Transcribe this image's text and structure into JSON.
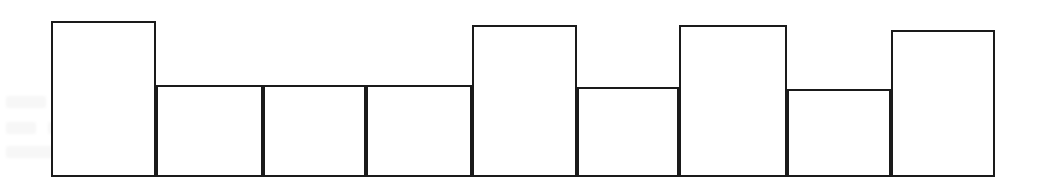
{
  "figure": {
    "title": "",
    "background_color": "#ffffff",
    "width": 1049,
    "height": 195
  },
  "chart_data": {
    "type": "bar",
    "title": "",
    "subtitle": "",
    "xlabel": "",
    "ylabel": "",
    "categories": [
      "1",
      "2",
      "3",
      "4",
      "5",
      "6",
      "7",
      "8",
      "9"
    ],
    "values": [
      155,
      91,
      91,
      91,
      151,
      89,
      151,
      87,
      146
    ],
    "bin_edges": [
      51,
      156,
      263,
      366,
      472,
      577,
      679,
      787,
      891,
      995
    ],
    "baseline_y": 176,
    "ylim": [
      0,
      160
    ],
    "grid": false,
    "legend": [],
    "legend_position": "none",
    "bar_fill_color": "#ffffff",
    "bar_edge_color": "#1a1a1a",
    "bar_edge_width": 2.2,
    "axes_visible": false,
    "tick_labels_x": [],
    "tick_labels_y": [],
    "annotations": [],
    "bars": [
      {
        "label": "1",
        "x0": 51,
        "x1": 156,
        "top": 21,
        "height": 155
      },
      {
        "label": "2",
        "x0": 156,
        "x1": 263,
        "top": 85,
        "height": 91
      },
      {
        "label": "3",
        "x0": 263,
        "x1": 366,
        "top": 85,
        "height": 91
      },
      {
        "label": "4",
        "x0": 366,
        "x1": 472,
        "top": 85,
        "height": 91
      },
      {
        "label": "5",
        "x0": 472,
        "x1": 577,
        "top": 25,
        "height": 151
      },
      {
        "label": "6",
        "x0": 577,
        "x1": 679,
        "top": 87,
        "height": 89
      },
      {
        "label": "7",
        "x0": 679,
        "x1": 787,
        "top": 25,
        "height": 151
      },
      {
        "label": "8",
        "x0": 787,
        "x1": 891,
        "top": 89,
        "height": 87
      },
      {
        "label": "9",
        "x0": 891,
        "x1": 995,
        "top": 30,
        "height": 146
      }
    ]
  },
  "background_artifacts": {
    "description": "faint scan ghosting",
    "blobs": [
      {
        "x": 6,
        "y": 96,
        "w": 40,
        "h": 12
      },
      {
        "x": 56,
        "y": 96,
        "w": 58,
        "h": 12
      },
      {
        "x": 126,
        "y": 96,
        "w": 30,
        "h": 12
      },
      {
        "x": 176,
        "y": 96,
        "w": 52,
        "h": 12
      },
      {
        "x": 244,
        "y": 96,
        "w": 36,
        "h": 12
      },
      {
        "x": 300,
        "y": 96,
        "w": 62,
        "h": 12
      },
      {
        "x": 380,
        "y": 96,
        "w": 26,
        "h": 12
      },
      {
        "x": 6,
        "y": 122,
        "w": 30,
        "h": 12
      },
      {
        "x": 48,
        "y": 122,
        "w": 48,
        "h": 12
      },
      {
        "x": 110,
        "y": 122,
        "w": 36,
        "h": 12
      },
      {
        "x": 160,
        "y": 122,
        "w": 58,
        "h": 12
      },
      {
        "x": 232,
        "y": 122,
        "w": 30,
        "h": 12
      },
      {
        "x": 276,
        "y": 122,
        "w": 44,
        "h": 12
      },
      {
        "x": 6,
        "y": 146,
        "w": 52,
        "h": 12
      },
      {
        "x": 70,
        "y": 146,
        "w": 34,
        "h": 12
      },
      {
        "x": 118,
        "y": 146,
        "w": 46,
        "h": 12
      },
      {
        "x": 180,
        "y": 146,
        "w": 28,
        "h": 12
      },
      {
        "x": 600,
        "y": 118,
        "w": 40,
        "h": 10
      },
      {
        "x": 660,
        "y": 118,
        "w": 26,
        "h": 10
      },
      {
        "x": 828,
        "y": 150,
        "w": 34,
        "h": 10
      }
    ]
  }
}
